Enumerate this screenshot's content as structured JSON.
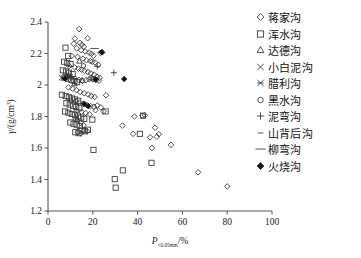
{
  "chart_data": {
    "type": "scatter",
    "title": "",
    "xlabel": "P<0.05mm/%",
    "xlabel_main": "P",
    "xlabel_sub": "<0.05mm",
    "xlabel_unit": "/%",
    "ylabel": "γ/(g/cm³)",
    "ylabel_main": "γ",
    "ylabel_unit": "/(g/cm",
    "ylabel_sup": "3",
    "ylabel_close": ")",
    "xlim": [
      0,
      100
    ],
    "ylim": [
      1.2,
      2.4
    ],
    "xticks": [
      0,
      20,
      40,
      60,
      80,
      100
    ],
    "yticks": [
      1.2,
      1.4,
      1.6,
      1.8,
      2.0,
      2.2,
      2.4
    ],
    "xtick_labels": [
      "0",
      "20",
      "40",
      "60",
      "80",
      "100"
    ],
    "ytick_labels": [
      "1.2",
      "1.4",
      "1.6",
      "1.8",
      "2",
      "2.2",
      "2.4"
    ],
    "grid": false,
    "legend_position": "right-outside",
    "series": [
      {
        "name": "蒋家沟",
        "marker": "diamond-open",
        "points": [
          [
            13.9,
            2.355
          ],
          [
            12.0,
            2.295
          ],
          [
            17.7,
            2.297
          ],
          [
            11.5,
            2.262
          ],
          [
            14.2,
            2.268
          ],
          [
            15.1,
            2.256
          ],
          [
            16.0,
            2.243
          ],
          [
            12.8,
            2.233
          ],
          [
            14.8,
            2.221
          ],
          [
            16.6,
            2.213
          ],
          [
            18.3,
            2.206
          ],
          [
            19.4,
            2.198
          ],
          [
            20.3,
            2.186
          ],
          [
            24.2,
            2.207
          ],
          [
            23.4,
            2.204
          ],
          [
            10.6,
            2.185
          ],
          [
            13.2,
            2.178
          ],
          [
            15.6,
            2.167
          ],
          [
            17.2,
            2.158
          ],
          [
            18.9,
            2.152
          ],
          [
            19.8,
            2.148
          ],
          [
            21.0,
            2.143
          ],
          [
            22.4,
            2.128
          ],
          [
            9.5,
            2.12
          ],
          [
            11.9,
            2.112
          ],
          [
            13.6,
            2.104
          ],
          [
            14.9,
            2.098
          ],
          [
            16.3,
            2.09
          ],
          [
            17.8,
            2.082
          ],
          [
            19.1,
            2.074
          ],
          [
            20.6,
            2.066
          ],
          [
            21.8,
            2.053
          ],
          [
            23.1,
            2.046
          ],
          [
            8.4,
            2.06
          ],
          [
            10.3,
            2.048
          ],
          [
            12.1,
            2.04
          ],
          [
            13.8,
            2.033
          ],
          [
            15.4,
            2.026
          ],
          [
            17.0,
            2.031
          ],
          [
            18.4,
            2.037
          ],
          [
            20.0,
            2.035
          ],
          [
            21.5,
            2.03
          ],
          [
            22.8,
            2.028
          ],
          [
            9.1,
            1.985
          ],
          [
            11.0,
            1.976
          ],
          [
            12.7,
            1.968
          ],
          [
            14.4,
            1.955
          ],
          [
            16.1,
            1.948
          ],
          [
            17.9,
            1.94
          ],
          [
            19.3,
            1.93
          ],
          [
            20.8,
            1.924
          ],
          [
            25.9,
            1.935
          ],
          [
            10.2,
            1.902
          ],
          [
            12.5,
            1.895
          ],
          [
            14.0,
            1.888
          ],
          [
            15.8,
            1.88
          ],
          [
            17.4,
            1.872
          ],
          [
            19.0,
            1.866
          ],
          [
            20.5,
            1.862
          ],
          [
            22.0,
            1.87
          ],
          [
            23.6,
            1.858
          ],
          [
            13.1,
            1.838
          ],
          [
            15.0,
            1.83
          ],
          [
            16.8,
            1.822
          ],
          [
            18.6,
            1.814
          ],
          [
            21.2,
            1.84
          ],
          [
            24.8,
            1.832
          ],
          [
            14.6,
            1.76
          ],
          [
            15.9,
            1.745
          ],
          [
            13.4,
            1.7
          ],
          [
            14.7,
            1.692
          ],
          [
            16.2,
            1.712
          ],
          [
            17.5,
            1.706
          ],
          [
            33.2,
            1.742
          ],
          [
            38.0,
            1.69
          ],
          [
            38.6,
            1.8
          ],
          [
            42.2,
            1.806
          ],
          [
            43.2,
            1.808
          ],
          [
            45.6,
            1.668
          ],
          [
            46.4,
            1.601
          ],
          [
            47.8,
            1.729
          ],
          [
            48.6,
            1.672
          ],
          [
            49.5,
            1.688
          ],
          [
            54.9,
            1.62
          ],
          [
            67.0,
            1.446
          ],
          [
            80.0,
            1.356
          ]
        ]
      },
      {
        "name": "浑水沟",
        "marker": "square-open",
        "points": [
          [
            7.8,
            2.237
          ],
          [
            9.0,
            2.185
          ],
          [
            7.2,
            2.148
          ],
          [
            8.6,
            2.14
          ],
          [
            10.1,
            2.133
          ],
          [
            6.6,
            2.093
          ],
          [
            8.0,
            2.086
          ],
          [
            9.4,
            2.078
          ],
          [
            11.0,
            2.07
          ],
          [
            7.4,
            2.047
          ],
          [
            8.9,
            2.04
          ],
          [
            10.4,
            2.032
          ],
          [
            11.8,
            2.025
          ],
          [
            13.0,
            2.018
          ],
          [
            6.2,
            1.938
          ],
          [
            7.9,
            1.93
          ],
          [
            9.3,
            1.922
          ],
          [
            10.7,
            1.915
          ],
          [
            12.1,
            1.908
          ],
          [
            13.5,
            1.9
          ],
          [
            8.2,
            1.884
          ],
          [
            9.7,
            1.876
          ],
          [
            11.2,
            1.868
          ],
          [
            12.6,
            1.86
          ],
          [
            14.0,
            1.852
          ],
          [
            7.6,
            1.832
          ],
          [
            9.1,
            1.824
          ],
          [
            10.6,
            1.816
          ],
          [
            12.0,
            1.808
          ],
          [
            13.4,
            1.8
          ],
          [
            14.8,
            1.793
          ],
          [
            16.2,
            1.785
          ],
          [
            19.8,
            1.78
          ],
          [
            10.0,
            1.762
          ],
          [
            11.4,
            1.754
          ],
          [
            12.8,
            1.748
          ],
          [
            14.2,
            1.74
          ],
          [
            12.2,
            1.7
          ],
          [
            13.6,
            1.694
          ],
          [
            15.0,
            1.712
          ],
          [
            16.4,
            1.706
          ],
          [
            17.8,
            1.716
          ],
          [
            20.3,
            1.588
          ],
          [
            29.8,
            1.402
          ],
          [
            30.2,
            1.348
          ],
          [
            33.4,
            1.458
          ],
          [
            42.4,
            1.805
          ],
          [
            46.2,
            1.506
          ],
          [
            41.0,
            1.69
          ],
          [
            25.7,
            1.832
          ]
        ]
      },
      {
        "name": "达德沟",
        "marker": "triangle-open",
        "points": [
          [
            14.0,
            2.152
          ],
          [
            12.4,
            1.79
          ],
          [
            13.2,
            1.782
          ],
          [
            15.2,
            2.03
          ],
          [
            11.8,
            2.008
          ]
        ]
      },
      {
        "name": "小白泥沟",
        "marker": "cross-x",
        "points": [
          [
            6.0,
            2.046
          ],
          [
            6.8,
            2.042
          ]
        ]
      },
      {
        "name": "腊利沟",
        "marker": "cross-x-bold",
        "points": [
          [
            9.2,
            2.06
          ],
          [
            9.8,
            2.052
          ]
        ]
      },
      {
        "name": "黑水沟",
        "marker": "circle-open",
        "points": [
          [
            15.8,
            2.122
          ],
          [
            19.2,
            2.044
          ],
          [
            20.0,
            2.04
          ]
        ]
      },
      {
        "name": "泥弯沟",
        "marker": "plus",
        "points": [
          [
            29.4,
            2.078
          ],
          [
            22.0,
            2.118
          ]
        ]
      },
      {
        "name": "山背后沟",
        "marker": "dash-short",
        "points": [
          [
            23.5,
            2.21
          ]
        ]
      },
      {
        "name": "柳弯沟",
        "marker": "dash-long",
        "points": [
          [
            20.8,
            2.232
          ]
        ]
      },
      {
        "name": "火烧沟",
        "marker": "diamond-filled",
        "points": [
          [
            7.6,
            2.042
          ],
          [
            18.0,
            1.866
          ],
          [
            21.3,
            2.036
          ],
          [
            34.0,
            2.038
          ],
          [
            16.2,
            1.88
          ],
          [
            24.0,
            2.208
          ]
        ]
      }
    ]
  },
  "legend": {
    "items": [
      {
        "label": "蒋家沟",
        "marker": "diamond-open"
      },
      {
        "label": "浑水沟",
        "marker": "square-open"
      },
      {
        "label": "达德沟",
        "marker": "triangle-open"
      },
      {
        "label": "小白泥沟",
        "marker": "cross-x"
      },
      {
        "label": "腊利沟",
        "marker": "cross-x-bold"
      },
      {
        "label": "黑水沟",
        "marker": "circle-open"
      },
      {
        "label": "泥弯沟",
        "marker": "plus"
      },
      {
        "label": "山背后沟",
        "marker": "dash-short"
      },
      {
        "label": "柳弯沟",
        "marker": "dash-long"
      },
      {
        "label": "火烧沟",
        "marker": "diamond-filled"
      }
    ]
  },
  "colors": {
    "marker_stroke": "#333333",
    "marker_fill": "#111111",
    "axis": "#555555",
    "text": "#1a1a1a",
    "background": "#ffffff"
  }
}
